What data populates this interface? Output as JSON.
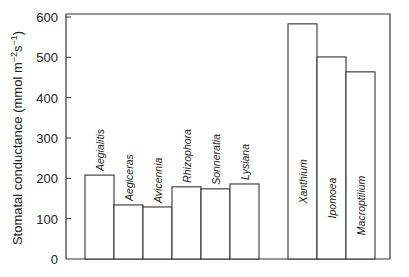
{
  "chart_data": {
    "type": "bar",
    "title": "",
    "xlabel": "",
    "ylabel": "Stomatal conductance (mmol m⁻²s⁻¹)",
    "ylabel_parts": {
      "main": "Stomatal conductance (mmol m",
      "sup1": "−2",
      "mid": "s",
      "sup2": "−1",
      "end": ")"
    },
    "ylim": [
      0,
      600
    ],
    "yticks": [
      0,
      100,
      200,
      300,
      400,
      500,
      600
    ],
    "grid": false,
    "legend": null,
    "categories": [
      "Aegialitis",
      "Aegiceras",
      "Avicennia",
      "Rhizophora",
      "Sonneratia",
      "Lysiana",
      "Xanthium",
      "Ipomoea",
      "Macroptilium"
    ],
    "values": [
      208,
      134,
      129,
      179,
      174,
      186,
      583,
      501,
      464
    ],
    "groups": [
      {
        "name": "mangroves",
        "categories": [
          "Aegialitis",
          "Aegiceras",
          "Avicennia",
          "Rhizophora",
          "Sonneratia",
          "Lysiana"
        ]
      },
      {
        "name": "non-mangroves",
        "categories": [
          "Xanthium",
          "Ipomoea",
          "Macroptilium"
        ]
      }
    ],
    "label_placement": [
      "above",
      "above",
      "above",
      "above",
      "above",
      "above",
      "inside",
      "inside",
      "inside"
    ],
    "colors": {
      "bar_fill": "#ffffff",
      "bar_stroke": "#333333",
      "axis": "#333333"
    }
  }
}
